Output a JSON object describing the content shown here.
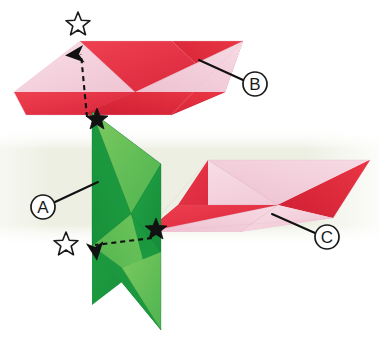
{
  "diagram": {
    "type": "origami-assembly-diagram",
    "canvas": {
      "width": 379,
      "height": 350
    },
    "background": {
      "page_color": "#ffffff",
      "band_color": "#edefe2",
      "band_label": "pale green background band"
    },
    "palette": {
      "red": "#e63946",
      "red_dark": "#cf2233",
      "red_deep": "#d62b3c",
      "pink": "#f3cbd7",
      "pink_light": "#f7dde5",
      "pink_pale": "#f6d8e1",
      "green_dark": "#1f9e43",
      "green_mid": "#2aa94a",
      "green_light": "#57bb53",
      "green_pale": "#76c65e",
      "ink": "#111111",
      "outline": "#1a1a1a"
    }
  },
  "labels": [
    {
      "id": "label-a",
      "text": "A",
      "circle": {
        "cx": 43,
        "cy": 207,
        "r": 12
      },
      "leader": {
        "x1": 55,
        "y1": 202,
        "x2": 98,
        "y2": 182
      },
      "describes": "green module on the left"
    },
    {
      "id": "label-b",
      "text": "B",
      "circle": {
        "cx": 255,
        "cy": 84,
        "r": 12
      },
      "leader": {
        "x1": 243,
        "y1": 80,
        "x2": 199,
        "y2": 60
      },
      "describes": "upper pink and red module"
    },
    {
      "id": "label-c",
      "text": "C",
      "circle": {
        "cx": 327,
        "cy": 237,
        "r": 12
      },
      "leader": {
        "x1": 315,
        "y1": 233,
        "x2": 272,
        "y2": 214
      },
      "describes": "right pink and red module"
    }
  ],
  "markers": {
    "hollow_stars": [
      {
        "id": "hollow-star-top",
        "cx": 78,
        "cy": 23,
        "r": 11,
        "note": "target position marker above upper module"
      },
      {
        "id": "hollow-star-bottom",
        "cx": 66,
        "cy": 243,
        "r": 11,
        "note": "target position marker at lower left"
      }
    ],
    "solid_stars": [
      {
        "id": "solid-star-upper",
        "cx": 97,
        "cy": 118,
        "r": 10,
        "note": "source point on green module, upper"
      },
      {
        "id": "solid-star-lower",
        "cx": 156,
        "cy": 228,
        "r": 10,
        "note": "source point where green meets right module"
      }
    ]
  },
  "arrows": [
    {
      "id": "arrow-up",
      "direction": "up",
      "style": "dashed-with-solid-head",
      "from": {
        "x": 87,
        "y": 117
      },
      "to": {
        "x": 81,
        "y": 46
      },
      "note": "move solid star up to hollow star"
    },
    {
      "id": "arrow-left",
      "direction": "left",
      "style": "dashed-with-solid-head",
      "from": {
        "x": 152,
        "y": 238
      },
      "to": {
        "x": 86,
        "y": 246
      },
      "note": "move solid star left to hollow star"
    }
  ],
  "modules": [
    {
      "id": "module-b",
      "label": "B",
      "description": "upper horizontal pinwheel parallelogram, red and pink"
    },
    {
      "id": "module-a",
      "label": "A",
      "description": "left vertical pinwheel parallelogram, dark and light green"
    },
    {
      "id": "module-c",
      "label": "C",
      "description": "right horizontal pinwheel parallelogram, pink and red"
    }
  ]
}
